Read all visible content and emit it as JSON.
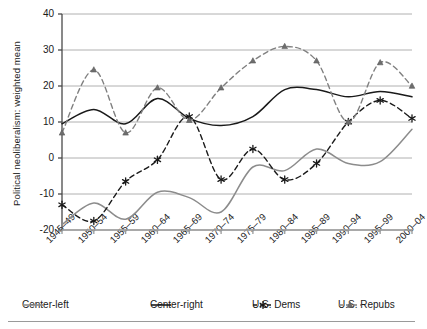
{
  "chart_data": {
    "type": "line",
    "title": "",
    "xlabel": "",
    "ylabel": "Political neoliberalism: weighted mean",
    "ylim": [
      -20,
      40
    ],
    "ytick_values": [
      40,
      30,
      20,
      10,
      0,
      -10,
      -20
    ],
    "ytick_labels": [
      "40",
      "30",
      "20",
      "10",
      "0",
      "-10",
      "-20"
    ],
    "grid": true,
    "legend_position": "bottom",
    "categories": [
      "1945–49",
      "1950–54",
      "1955–59",
      "1960–64",
      "1965–69",
      "1970–74",
      "1975–79",
      "1980–84",
      "1985–89",
      "1990–94",
      "1995–99",
      "2000–04"
    ],
    "series": [
      {
        "name": "Center-left",
        "style": "solid",
        "color": "#8c8c8c",
        "marker": "none",
        "values": [
          -18.5,
          -12.5,
          -17,
          -9.5,
          -11,
          -15,
          -2.5,
          -3.5,
          2.5,
          -1.5,
          -1,
          8
        ]
      },
      {
        "name": "Center-right",
        "style": "solid",
        "color": "#1a1a1a",
        "marker": "none",
        "values": [
          9.5,
          13.5,
          9.5,
          16.5,
          11,
          9,
          11.5,
          19,
          19,
          17,
          18.5,
          17
        ]
      },
      {
        "name": "U.S. Dems",
        "style": "dashed",
        "color": "#1a1a1a",
        "marker": "asterisk",
        "values": [
          -13,
          -17.5,
          -6.5,
          -0.5,
          11.5,
          -6,
          2.5,
          -6,
          -1.5,
          10,
          16,
          11
        ]
      },
      {
        "name": "U.S. Repubs",
        "style": "dashed",
        "color": "#808080",
        "marker": "triangle",
        "values": [
          7,
          24.5,
          7,
          19.5,
          10.5,
          19.5,
          27,
          31,
          27,
          10,
          26.5,
          20
        ]
      }
    ]
  },
  "legend": {
    "items": [
      {
        "label": "Center-left",
        "key": "center-left"
      },
      {
        "label": "Center-right",
        "key": "center-right"
      },
      {
        "label": "U.S. Dems",
        "key": "us-dems"
      },
      {
        "label": "U.S. Repubs",
        "key": "us-repubs"
      }
    ]
  }
}
